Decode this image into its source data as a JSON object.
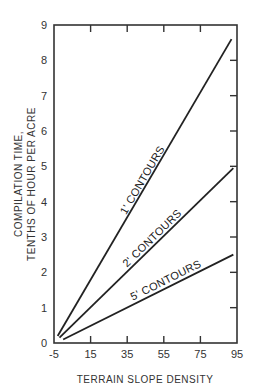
{
  "chart_data": {
    "type": "line",
    "title": "",
    "xlabel": "TERRAIN SLOPE DENSITY",
    "ylabel_line1": "COMPILATION  TIME,",
    "ylabel_line2": "TENTHS  OF  HOUR  PER  ACRE",
    "xlim": [
      -5,
      95
    ],
    "ylim": [
      0,
      9
    ],
    "x_ticks": [
      "-5",
      "15",
      "35",
      "55",
      "75",
      "95"
    ],
    "y_ticks": [
      "0",
      "1",
      "2",
      "3",
      "4",
      "5",
      "6",
      "7",
      "8",
      "9"
    ],
    "grid": false,
    "legend": "inline labels",
    "series": [
      {
        "name": "1' CONTOURS",
        "x": [
          -3,
          92
        ],
        "values": [
          0.2,
          8.6
        ]
      },
      {
        "name": "2' CONTOURS",
        "x": [
          -2,
          93
        ],
        "values": [
          0.15,
          4.95
        ]
      },
      {
        "name": "5' CONTOURS",
        "x": [
          0,
          93
        ],
        "values": [
          0.1,
          2.5
        ]
      }
    ]
  }
}
